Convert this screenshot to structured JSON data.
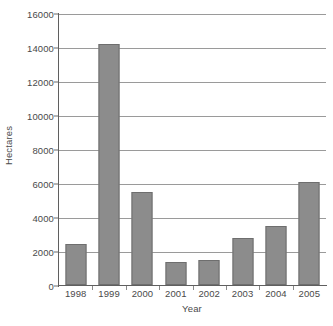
{
  "chart_data": {
    "type": "bar",
    "title": "",
    "subtitle": "",
    "xlabel": "Year",
    "ylabel": "Hectares",
    "categories": [
      "1998",
      "1999",
      "2000",
      "2001",
      "2002",
      "2003",
      "2004",
      "2005"
    ],
    "values": [
      2440,
      14150,
      5450,
      1380,
      1500,
      2750,
      3500,
      6050
    ],
    "series": [
      {
        "name": "Hectares",
        "values": [
          2440,
          14150,
          5450,
          1380,
          1500,
          2750,
          3500,
          6050
        ]
      }
    ],
    "ylim": [
      0,
      16000
    ],
    "ytick_values": [
      0,
      2000,
      4000,
      6000,
      8000,
      10000,
      12000,
      14000,
      16000
    ],
    "ytick_labels": [
      "0",
      "2000",
      "4000",
      "6000",
      "8000",
      "10000",
      "12000",
      "14000",
      "16000"
    ],
    "grid": "horizontal",
    "legend": "none",
    "annotations": [],
    "colors": {
      "bar_fill": "#8c8c8c",
      "bar_edge": "#6e6e6e",
      "gridline": "#9a9a9a",
      "axis": "#5f5f5f",
      "text": "#4a4a4a",
      "background": "#ffffff"
    }
  }
}
